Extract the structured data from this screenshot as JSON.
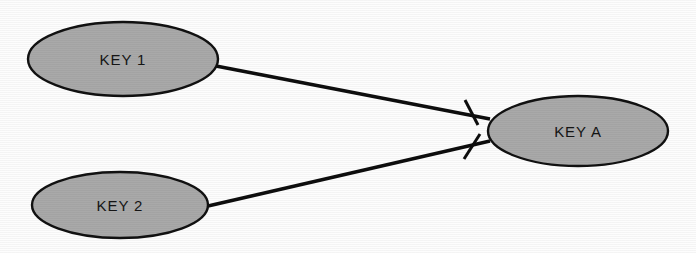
{
  "diagram": {
    "type": "entity-relationship-diagram",
    "background_color": "#fdfdfd",
    "entity_fill_color": "#a9a9a9",
    "entity_stroke_color": "#111111",
    "line_color": "#0d0d0d",
    "text_color": "#151515",
    "entities": [
      {
        "id": "key-1",
        "label": "KEY 1",
        "cx": 123,
        "cy": 59,
        "rx": 95,
        "ry": 37
      },
      {
        "id": "key-2",
        "label": "KEY 2",
        "cx": 120,
        "cy": 205,
        "rx": 88,
        "ry": 33
      },
      {
        "id": "key-a",
        "label": "KEY A",
        "cx": 578,
        "cy": 131,
        "rx": 90,
        "ry": 35
      }
    ],
    "relationships": [
      {
        "id": "key-1-to-key-a",
        "from": "key-1",
        "to": "key-a",
        "from_x": 216,
        "from_y": 66,
        "to_x": 490,
        "to_y": 119,
        "cardinality": "one",
        "tick": {
          "cx": 471,
          "cy": 112,
          "x1": 465,
          "y1": 100,
          "x2": 478,
          "y2": 125
        }
      },
      {
        "id": "key-2-to-key-a",
        "from": "key-2",
        "to": "key-a",
        "from_x": 208,
        "from_y": 206,
        "to_x": 490,
        "to_y": 141,
        "cardinality": "one",
        "tick": {
          "cx": 472,
          "cy": 146,
          "x1": 464,
          "y1": 159,
          "x2": 480,
          "y2": 134
        }
      }
    ]
  }
}
